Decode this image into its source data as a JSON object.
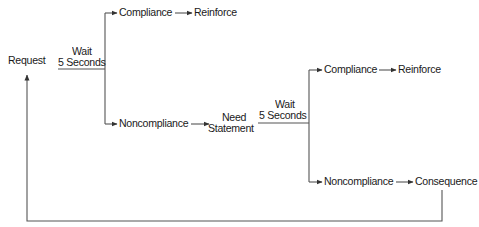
{
  "diagram": {
    "type": "flowchart",
    "line_color": "#555555",
    "text_color": "#1a1a1a",
    "nodes": {
      "request": "Request",
      "wait1_line1": "Wait",
      "wait1_line2": "5 Seconds",
      "compliance1": "Compliance",
      "reinforce1": "Reinforce",
      "noncompliance1": "Noncompliance",
      "need_line1": "Need",
      "need_line2": "Statement",
      "wait2_line1": "Wait",
      "wait2_line2": "5 Seconds",
      "compliance2": "Compliance",
      "reinforce2": "Reinforce",
      "noncompliance2": "Noncompliance",
      "consequence": "Consequence"
    },
    "edges": [
      {
        "from": "Request",
        "to": "Compliance",
        "label": "Wait 5 Seconds"
      },
      {
        "from": "Request",
        "to": "Noncompliance",
        "label": "Wait 5 Seconds"
      },
      {
        "from": "Compliance",
        "to": "Reinforce"
      },
      {
        "from": "Noncompliance",
        "to": "Need Statement"
      },
      {
        "from": "Need Statement",
        "to": "Compliance",
        "label": "Wait 5 Seconds"
      },
      {
        "from": "Need Statement",
        "to": "Noncompliance",
        "label": "Wait 5 Seconds"
      },
      {
        "from": "Compliance",
        "to": "Reinforce"
      },
      {
        "from": "Noncompliance",
        "to": "Consequence"
      },
      {
        "from": "Consequence",
        "to": "Request"
      }
    ]
  }
}
